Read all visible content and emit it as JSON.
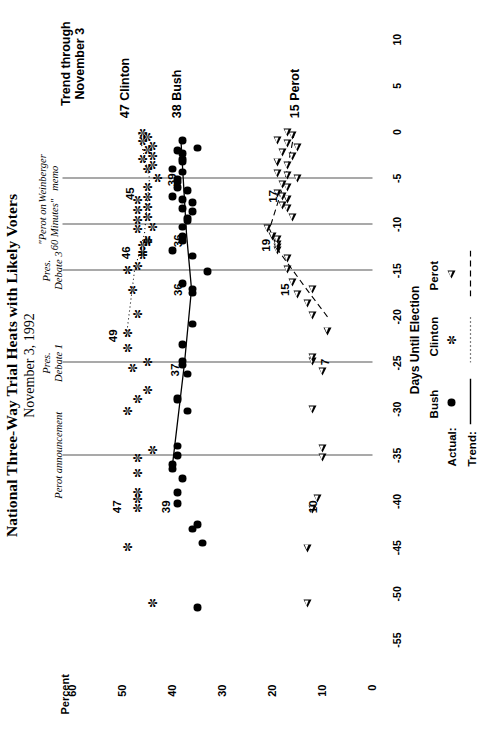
{
  "title": "National Three-Way Trial Heats with Likely Voters",
  "subtitle": "November 3, 1992",
  "axes": {
    "y_title": "Percent",
    "x_title": "Days Until Election",
    "y_ticks": [
      "60",
      "50",
      "40",
      "30",
      "20",
      "10",
      "0"
    ],
    "x_ticks": [
      "-55",
      "-50",
      "-45",
      "-40",
      "-35",
      "-30",
      "-25",
      "-20",
      "-15",
      "-10",
      "-5",
      "0",
      "5",
      "10"
    ]
  },
  "trend_header": "Trend through\nNovember 3",
  "events": [
    {
      "label": "Perot announcement",
      "x": -35
    },
    {
      "label": "Pres.\nDebate 1",
      "x": -25
    },
    {
      "label": "Pres.\nDebate 3",
      "x": -15
    },
    {
      "label": "\"Perot on\n60 Minutes\"",
      "x": -10
    },
    {
      "label": "Weinberger\nmemo",
      "x": -5
    }
  ],
  "end_labels": [
    {
      "text": "47  Clinton",
      "series": "clinton"
    },
    {
      "text": "38  Bush",
      "series": "bush"
    },
    {
      "text": "15  Perot",
      "series": "perot"
    }
  ],
  "callouts": [
    {
      "text": "47",
      "series": "clinton",
      "x": -40.5,
      "y": 50.8
    },
    {
      "text": "49",
      "series": "clinton",
      "x": -22.0,
      "y": 51.6
    },
    {
      "text": "46",
      "series": "clinton",
      "x": -13.0,
      "y": 49.0
    },
    {
      "text": "45",
      "series": "clinton",
      "x": -6.6,
      "y": 48.2
    },
    {
      "text": "39",
      "series": "bush",
      "x": -40.5,
      "y": 41.0
    },
    {
      "text": "37",
      "series": "bush",
      "x": -25.7,
      "y": 39.2
    },
    {
      "text": "36",
      "series": "bush",
      "x": -17.0,
      "y": 38.6
    },
    {
      "text": "36",
      "series": "bush",
      "x": -11.7,
      "y": 38.6
    },
    {
      "text": "39",
      "series": "bush",
      "x": -5.1,
      "y": 39.9
    },
    {
      "text": "10",
      "series": "perot",
      "x": -40.5,
      "y": 11.6
    },
    {
      "text": "7",
      "series": "perot",
      "x": -24.5,
      "y": 9.3
    },
    {
      "text": "15",
      "series": "perot",
      "x": -17.0,
      "y": 17.2
    },
    {
      "text": "19",
      "series": "perot",
      "x": -12.2,
      "y": 21.0
    },
    {
      "text": "17",
      "series": "perot",
      "x": -6.9,
      "y": 19.6
    }
  ],
  "legend": {
    "rows": [
      "Actual:",
      "Trend:"
    ],
    "series": [
      {
        "name": "Bush",
        "symbol": "filled-circle",
        "line": "solid"
      },
      {
        "name": "Clinton",
        "symbol": "asterisk",
        "line": "dotted"
      },
      {
        "name": "Perot",
        "symbol": "open-triangle",
        "line": "dashed"
      }
    ]
  },
  "chart_data": {
    "type": "scatter",
    "title": "National Three-Way Trial Heats with Likely Voters",
    "subtitle": "November 3, 1992",
    "xlabel": "Days Until Election",
    "ylabel": "Percent",
    "xlim": [
      -57,
      11
    ],
    "ylim": [
      0,
      62
    ],
    "grid": false,
    "legend_position": "bottom-right",
    "series": [
      {
        "name": "Bush",
        "marker": "filled-circle",
        "trend_line": "solid",
        "points": [
          [
            -51.5,
            35.0
          ],
          [
            -44.5,
            34.0
          ],
          [
            -43.0,
            36.0
          ],
          [
            -42.5,
            35.0
          ],
          [
            -40.2,
            39.0
          ],
          [
            -39.0,
            39.0
          ],
          [
            -37.5,
            38.0
          ],
          [
            -36.5,
            40.0
          ],
          [
            -36.0,
            40.0
          ],
          [
            -35.0,
            39.0
          ],
          [
            -34.0,
            39.0
          ],
          [
            -30.2,
            37.0
          ],
          [
            -29.0,
            39.0
          ],
          [
            -28.8,
            39.0
          ],
          [
            -26.2,
            37.0
          ],
          [
            -25.2,
            38.0
          ],
          [
            -24.8,
            38.0
          ],
          [
            -23.0,
            38.0
          ],
          [
            -20.8,
            36.0
          ],
          [
            -17.4,
            36.0
          ],
          [
            -17.0,
            36.0
          ],
          [
            -16.4,
            38.0
          ],
          [
            -15.1,
            33.0
          ],
          [
            -13.4,
            36.0
          ],
          [
            -12.8,
            40.0
          ],
          [
            -11.8,
            38.0
          ],
          [
            -11.3,
            38.0
          ],
          [
            -10.3,
            38.0
          ],
          [
            -9.6,
            37.0
          ],
          [
            -9.3,
            37.0
          ],
          [
            -8.6,
            36.0
          ],
          [
            -8.3,
            38.0
          ],
          [
            -7.6,
            36.0
          ],
          [
            -7.3,
            38.0
          ],
          [
            -7.0,
            40.0
          ],
          [
            -6.3,
            37.0
          ],
          [
            -6.0,
            39.0
          ],
          [
            -5.4,
            39.0
          ],
          [
            -5.1,
            39.0
          ],
          [
            -4.3,
            38.0
          ],
          [
            -4.0,
            40.0
          ],
          [
            -3.2,
            38.0
          ],
          [
            -2.9,
            38.0
          ],
          [
            -2.3,
            38.0
          ],
          [
            -2.0,
            39.0
          ],
          [
            -1.7,
            35.0
          ],
          [
            -0.9,
            38.0
          ]
        ],
        "trend": [
          [
            -36.0,
            40.0
          ],
          [
            -25.0,
            37.6
          ],
          [
            -17.0,
            36.2
          ],
          [
            -11.0,
            37.2
          ],
          [
            -1.0,
            38.3
          ]
        ],
        "final_value": 38
      },
      {
        "name": "Clinton",
        "marker": "asterisk",
        "trend_line": "dotted",
        "points": [
          [
            -51.0,
            44.0
          ],
          [
            -45.0,
            49.0
          ],
          [
            -40.8,
            47.0
          ],
          [
            -39.8,
            47.0
          ],
          [
            -39.0,
            47.0
          ],
          [
            -37.0,
            47.0
          ],
          [
            -35.3,
            47.0
          ],
          [
            -34.5,
            44.0
          ],
          [
            -30.2,
            49.0
          ],
          [
            -29.0,
            47.0
          ],
          [
            -28.0,
            45.0
          ],
          [
            -25.6,
            48.0
          ],
          [
            -25.0,
            45.0
          ],
          [
            -23.4,
            49.0
          ],
          [
            -21.8,
            49.0
          ],
          [
            -19.8,
            47.0
          ],
          [
            -17.2,
            48.0
          ],
          [
            -15.0,
            49.0
          ],
          [
            -14.5,
            47.0
          ],
          [
            -13.4,
            46.0
          ],
          [
            -13.0,
            46.0
          ],
          [
            -12.3,
            46.0
          ],
          [
            -12.0,
            45.0
          ],
          [
            -11.7,
            45.0
          ],
          [
            -10.6,
            47.0
          ],
          [
            -10.3,
            44.0
          ],
          [
            -9.6,
            47.0
          ],
          [
            -9.3,
            45.0
          ],
          [
            -8.5,
            47.0
          ],
          [
            -8.2,
            45.0
          ],
          [
            -7.4,
            47.0
          ],
          [
            -7.1,
            45.0
          ],
          [
            -6.0,
            45.0
          ],
          [
            -5.0,
            43.0
          ],
          [
            -4.0,
            45.0
          ],
          [
            -3.6,
            44.0
          ],
          [
            -3.0,
            46.0
          ],
          [
            -2.6,
            44.0
          ],
          [
            -2.0,
            45.0
          ],
          [
            -1.6,
            44.0
          ],
          [
            -1.0,
            46.0
          ],
          [
            -0.6,
            45.0
          ],
          [
            -0.1,
            46.0
          ]
        ],
        "trend": [
          [
            -22.0,
            49.2
          ],
          [
            -15.0,
            47.6
          ],
          [
            -11.0,
            45.6
          ],
          [
            -5.0,
            44.6
          ],
          [
            0.0,
            46.8
          ]
        ],
        "final_value": 47
      },
      {
        "name": "Perot",
        "marker": "open-triangle",
        "trend_line": "dashed",
        "points": [
          [
            -51.0,
            13.0
          ],
          [
            -45.0,
            13.0
          ],
          [
            -40.8,
            12.0
          ],
          [
            -39.6,
            11.0
          ],
          [
            -35.2,
            10.0
          ],
          [
            -34.2,
            10.0
          ],
          [
            -30.0,
            12.0
          ],
          [
            -25.9,
            10.0
          ],
          [
            -24.8,
            12.0
          ],
          [
            -24.4,
            12.0
          ],
          [
            -21.5,
            9.0
          ],
          [
            -19.8,
            12.0
          ],
          [
            -18.5,
            13.0
          ],
          [
            -17.5,
            15.0
          ],
          [
            -17.0,
            12.0
          ],
          [
            -16.2,
            16.0
          ],
          [
            -14.8,
            17.0
          ],
          [
            -13.6,
            17.0
          ],
          [
            -12.8,
            19.0
          ],
          [
            -12.4,
            19.0
          ],
          [
            -12.1,
            19.0
          ],
          [
            -11.6,
            19.0
          ],
          [
            -11.2,
            20.0
          ],
          [
            -10.4,
            21.0
          ],
          [
            -9.2,
            16.0
          ],
          [
            -8.2,
            17.0
          ],
          [
            -7.9,
            18.0
          ],
          [
            -7.2,
            17.0
          ],
          [
            -6.9,
            18.0
          ],
          [
            -6.6,
            19.0
          ],
          [
            -6.0,
            17.0
          ],
          [
            -5.6,
            18.0
          ],
          [
            -5.0,
            15.0
          ],
          [
            -4.7,
            17.0
          ],
          [
            -4.4,
            19.0
          ],
          [
            -3.6,
            17.0
          ],
          [
            -3.2,
            19.0
          ],
          [
            -2.6,
            16.0
          ],
          [
            -2.2,
            18.0
          ],
          [
            -1.6,
            15.0
          ],
          [
            -1.2,
            17.0
          ],
          [
            -0.9,
            19.0
          ],
          [
            -0.3,
            16.0
          ],
          [
            0.0,
            17.0
          ]
        ],
        "trend": [
          [
            -20.0,
            9.0
          ],
          [
            -17.0,
            13.2
          ],
          [
            -13.0,
            18.6
          ],
          [
            -10.5,
            20.6
          ],
          [
            -5.0,
            17.4
          ],
          [
            0.0,
            15.6
          ]
        ],
        "final_value": 15
      }
    ],
    "event_markers": [
      {
        "label": "Perot announcement",
        "x": -35
      },
      {
        "label": "Pres. Debate 1",
        "x": -25
      },
      {
        "label": "Pres. Debate 3",
        "x": -15
      },
      {
        "label": "\"Perot on 60 Minutes\"",
        "x": -10
      },
      {
        "label": "Weinberger memo",
        "x": -5
      }
    ]
  }
}
